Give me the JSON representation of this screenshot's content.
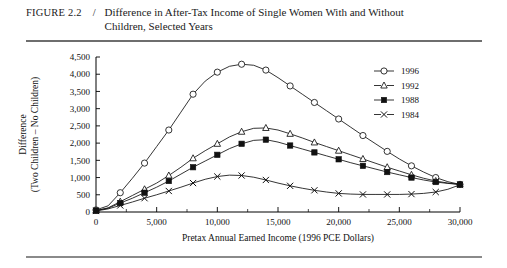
{
  "figure": {
    "label": "FIGURE 2.2",
    "separator": "/",
    "title": "Difference in After-Tax Income of Single Women With and Without Children, Selected Years"
  },
  "chart_data": {
    "type": "line",
    "title": "Difference in After-Tax Income of Single Women With and Without Children, Selected Years",
    "xlabel": "Pretax Annual Earned Income (1996 PCE Dollars)",
    "ylabel": "Difference (Two Children – No Children)",
    "ylabel_line1": "Difference",
    "ylabel_line2": "(Two Children – No Children)",
    "xlim": [
      0,
      30000
    ],
    "ylim": [
      0,
      4500
    ],
    "grid": false,
    "legend_position": "upper right",
    "xticks": [
      0,
      5000,
      10000,
      15000,
      20000,
      25000,
      30000
    ],
    "xticklabels": [
      "0",
      "5,000",
      "10,000",
      "15,000",
      "20,000",
      "25,000",
      "30,000"
    ],
    "xminorticks": [
      2500,
      7500,
      12500,
      17500,
      22500,
      27500
    ],
    "yticks": [
      0,
      500,
      1000,
      1500,
      2000,
      2500,
      3000,
      3500,
      4000,
      4500
    ],
    "yticklabels": [
      "0",
      "500",
      "1,000",
      "1,500",
      "2,000",
      "2,500",
      "3,000",
      "3,500",
      "4,000",
      "4,500"
    ],
    "x": [
      0,
      1000,
      2000,
      3000,
      4000,
      5000,
      6000,
      7000,
      8000,
      9000,
      10000,
      11000,
      12000,
      13000,
      14000,
      15000,
      16000,
      17000,
      18000,
      19000,
      20000,
      21000,
      22000,
      23000,
      24000,
      25000,
      26000,
      27000,
      28000,
      29000,
      30000
    ],
    "series": [
      {
        "name": "1996",
        "marker": "open-circle",
        "values": [
          60,
          180,
          560,
          980,
          1420,
          1900,
          2380,
          2900,
          3420,
          3800,
          4060,
          4230,
          4290,
          4260,
          4120,
          3900,
          3660,
          3420,
          3180,
          2940,
          2700,
          2460,
          2220,
          1990,
          1760,
          1540,
          1340,
          1160,
          1000,
          880,
          800
        ]
      },
      {
        "name": "1992",
        "marker": "open-triangle",
        "values": [
          40,
          120,
          300,
          480,
          660,
          840,
          1060,
          1300,
          1560,
          1780,
          1980,
          2180,
          2330,
          2430,
          2440,
          2380,
          2270,
          2150,
          2020,
          1900,
          1780,
          1660,
          1540,
          1420,
          1300,
          1190,
          1080,
          980,
          900,
          840,
          800
        ]
      },
      {
        "name": "1988",
        "marker": "filled-square",
        "values": [
          40,
          110,
          260,
          400,
          560,
          720,
          900,
          1100,
          1300,
          1480,
          1660,
          1840,
          1980,
          2080,
          2100,
          2030,
          1930,
          1830,
          1730,
          1630,
          1530,
          1430,
          1340,
          1250,
          1160,
          1080,
          1000,
          930,
          870,
          830,
          800
        ]
      },
      {
        "name": "1984",
        "marker": "cross",
        "values": [
          30,
          90,
          190,
          290,
          400,
          500,
          610,
          720,
          840,
          950,
          1030,
          1070,
          1060,
          1010,
          930,
          840,
          760,
          690,
          630,
          580,
          540,
          520,
          510,
          510,
          510,
          510,
          520,
          540,
          580,
          660,
          790
        ]
      }
    ],
    "legend": [
      {
        "label": "1996",
        "marker": "open-circle"
      },
      {
        "label": "1992",
        "marker": "open-triangle"
      },
      {
        "label": "1988",
        "marker": "filled-square"
      },
      {
        "label": "1984",
        "marker": "cross"
      }
    ],
    "colors": {
      "ink": "#111111",
      "axis": "#000000",
      "background": "#ffffff"
    }
  }
}
